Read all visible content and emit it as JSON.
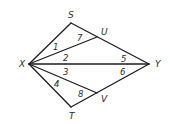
{
  "diagram": {
    "type": "geometry-figure",
    "vertices": {
      "X": {
        "label": "X",
        "x": 29,
        "y": 64,
        "label_x": 19,
        "label_y": 67
      },
      "S": {
        "label": "S",
        "x": 71,
        "y": 23,
        "label_x": 68,
        "label_y": 18
      },
      "U": {
        "label": "U",
        "x": 97,
        "y": 37,
        "label_x": 101,
        "label_y": 35
      },
      "Y": {
        "label": "Y",
        "x": 149,
        "y": 64,
        "label_x": 155,
        "label_y": 67
      },
      "V": {
        "label": "V",
        "x": 97,
        "y": 93,
        "label_x": 101,
        "label_y": 102
      },
      "T": {
        "label": "T",
        "x": 71,
        "y": 107,
        "label_x": 69,
        "label_y": 119
      }
    },
    "segments": [
      {
        "from": "X",
        "to": "S"
      },
      {
        "from": "S",
        "to": "Y"
      },
      {
        "from": "X",
        "to": "U"
      },
      {
        "from": "X",
        "to": "Y"
      },
      {
        "from": "X",
        "to": "V"
      },
      {
        "from": "X",
        "to": "T"
      },
      {
        "from": "T",
        "to": "Y"
      }
    ],
    "angle_labels": [
      {
        "label": "1",
        "x": 53,
        "y": 50
      },
      {
        "label": "7",
        "x": 77,
        "y": 41
      },
      {
        "label": "2",
        "x": 63,
        "y": 61
      },
      {
        "label": "5",
        "x": 121,
        "y": 62
      },
      {
        "label": "3",
        "x": 63,
        "y": 75
      },
      {
        "label": "6",
        "x": 120,
        "y": 75
      },
      {
        "label": "4",
        "x": 54,
        "y": 87
      },
      {
        "label": "8",
        "x": 78,
        "y": 97
      }
    ]
  }
}
